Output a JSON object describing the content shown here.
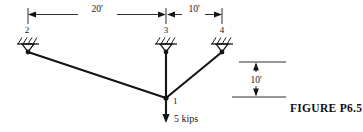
{
  "figure": {
    "caption": "FIGURE  P6.5",
    "type": "structural-truss-diagram"
  },
  "dimensions": {
    "top_span_left": "20'",
    "top_span_right": "10'",
    "vertical_height": "10'"
  },
  "nodes": [
    {
      "id": "1",
      "label": "1",
      "x": 166,
      "y": 98,
      "support": "none"
    },
    {
      "id": "2",
      "label": "2",
      "x": 28,
      "y": 52,
      "support": "pin"
    },
    {
      "id": "3",
      "label": "3",
      "x": 166,
      "y": 52,
      "support": "pin"
    },
    {
      "id": "4",
      "label": "4",
      "x": 222,
      "y": 52,
      "support": "pin"
    }
  ],
  "members": [
    {
      "from": "2",
      "to": "1"
    },
    {
      "from": "3",
      "to": "1"
    },
    {
      "from": "4",
      "to": "1"
    }
  ],
  "load": {
    "magnitude": "5 kips",
    "direction": "down",
    "applied_at": "1"
  },
  "colors": {
    "ink": "#16181c",
    "member": "#121418",
    "background": "#ffffff"
  }
}
